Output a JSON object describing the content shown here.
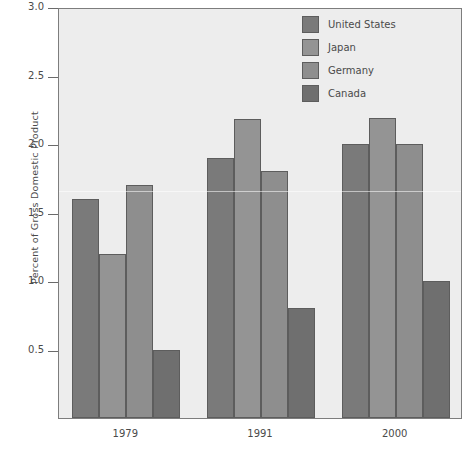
{
  "chart_data": {
    "type": "bar",
    "title": "",
    "subtitle": "",
    "xlabel": "",
    "ylabel": "Percent of Gross Domestic Product",
    "categories": [
      "1979",
      "1991",
      "2000"
    ],
    "series": [
      {
        "name": "United States",
        "values": [
          1.6,
          1.9,
          2.0
        ],
        "color": "#7a7a7a"
      },
      {
        "name": "Japan",
        "values": [
          1.2,
          2.18,
          2.19
        ],
        "color": "#949494"
      },
      {
        "name": "Germany",
        "values": [
          1.7,
          1.8,
          2.0
        ],
        "color": "#8e8e8e"
      },
      {
        "name": "Canada",
        "values": [
          0.5,
          0.8,
          1.0
        ],
        "color": "#6f6f6f"
      }
    ],
    "ylim": [
      0.0,
      3.0
    ],
    "yticks": [
      0.5,
      1.0,
      1.5,
      2.0,
      2.5,
      3.0
    ],
    "ytick_labels": [
      "0.5",
      "1.0",
      "1.5",
      "2.0",
      "2.5",
      "3.0"
    ],
    "grid": false,
    "legend_position": "top-right",
    "plot_background": "#ededed",
    "figure_background": "#ffffff",
    "axis_color": "#7d7d7d",
    "text_color": "#4a4a4a"
  },
  "legend": {
    "entries": [
      {
        "label": "United States"
      },
      {
        "label": "Japan"
      },
      {
        "label": "Germany"
      },
      {
        "label": "Canada"
      }
    ]
  },
  "axes": {
    "y_title": "Percent of Gross Domestic Product",
    "y_tick_labels": [
      "3.0",
      "2.5",
      "2.0",
      "1.5",
      "1.0",
      "0.5"
    ],
    "x_tick_labels": [
      "1979",
      "1991",
      "2000"
    ]
  }
}
